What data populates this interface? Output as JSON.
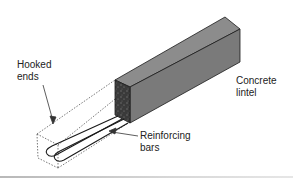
{
  "figure": {
    "type": "isometric illustration"
  },
  "labels": {
    "hooked_ends": "Hooked\nends",
    "concrete_lintel": "Concrete\nlintel",
    "reinforcing_bars": "Reinforcing\nbars"
  },
  "colors": {
    "lintel_side": "#7a7a7a",
    "lintel_top": "#8c8c8c",
    "lintel_end": "#3a3a3a",
    "lines": "#1a1a1a",
    "dotted_outline": "#555555",
    "text": "#222222",
    "background": "#ffffff"
  }
}
